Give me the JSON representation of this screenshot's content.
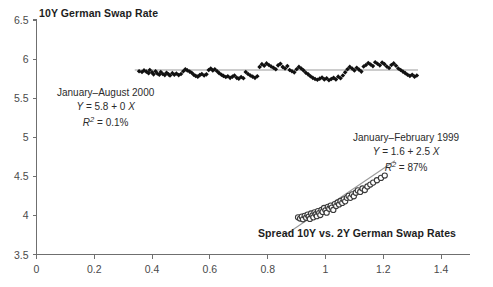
{
  "chart_data": {
    "type": "scatter",
    "title": "10Y German Swap Rate",
    "xlabel": "Spread 10Y vs. 2Y German Swap Rates",
    "ylabel": "10Y German Swap Rate",
    "xlim": [
      0,
      1.5
    ],
    "ylim": [
      3.5,
      6.5
    ],
    "xticks": [
      "0",
      "0.2",
      "0.4",
      "0.6",
      "0.8",
      "1",
      "1.2",
      "1.4"
    ],
    "xtick_values": [
      0,
      0.2,
      0.4,
      0.6,
      0.8,
      1.0,
      1.2,
      1.4
    ],
    "yticks": [
      "3.5",
      "4",
      "4.5",
      "5",
      "5.5",
      "6",
      "6.5"
    ],
    "ytick_values": [
      3.5,
      4,
      4.5,
      5,
      5.5,
      6,
      6.5
    ],
    "grid": false,
    "legend": "none",
    "series": [
      {
        "name": "January–August 2000",
        "marker": "filled-diamond",
        "color": "#111111",
        "equation": "Y = 5.8 + 0 X",
        "r_squared": "R2 = 0.1%",
        "fit": {
          "intercept": 5.86,
          "slope": 0.0,
          "x_start": 0.34,
          "x_end": 1.32
        },
        "points": [
          [
            0.355,
            5.845
          ],
          [
            0.365,
            5.835
          ],
          [
            0.372,
            5.855
          ],
          [
            0.38,
            5.84
          ],
          [
            0.388,
            5.82
          ],
          [
            0.392,
            5.86
          ],
          [
            0.4,
            5.83
          ],
          [
            0.405,
            5.805
          ],
          [
            0.412,
            5.845
          ],
          [
            0.418,
            5.815
          ],
          [
            0.425,
            5.8
          ],
          [
            0.43,
            5.835
          ],
          [
            0.437,
            5.81
          ],
          [
            0.444,
            5.795
          ],
          [
            0.45,
            5.825
          ],
          [
            0.457,
            5.805
          ],
          [
            0.462,
            5.79
          ],
          [
            0.47,
            5.82
          ],
          [
            0.477,
            5.8
          ],
          [
            0.484,
            5.815
          ],
          [
            0.492,
            5.795
          ],
          [
            0.5,
            5.81
          ],
          [
            0.508,
            5.845
          ],
          [
            0.515,
            5.87
          ],
          [
            0.522,
            5.855
          ],
          [
            0.53,
            5.84
          ],
          [
            0.537,
            5.825
          ],
          [
            0.544,
            5.8
          ],
          [
            0.551,
            5.785
          ],
          [
            0.558,
            5.775
          ],
          [
            0.565,
            5.795
          ],
          [
            0.572,
            5.81
          ],
          [
            0.58,
            5.79
          ],
          [
            0.588,
            5.805
          ],
          [
            0.596,
            5.86
          ],
          [
            0.603,
            5.88
          ],
          [
            0.61,
            5.855
          ],
          [
            0.617,
            5.87
          ],
          [
            0.625,
            5.845
          ],
          [
            0.632,
            5.82
          ],
          [
            0.64,
            5.8
          ],
          [
            0.647,
            5.785
          ],
          [
            0.655,
            5.77
          ],
          [
            0.662,
            5.78
          ],
          [
            0.67,
            5.76
          ],
          [
            0.678,
            5.775
          ],
          [
            0.685,
            5.79
          ],
          [
            0.693,
            5.76
          ],
          [
            0.7,
            5.75
          ],
          [
            0.708,
            5.77
          ],
          [
            0.716,
            5.755
          ],
          [
            0.724,
            5.835
          ],
          [
            0.732,
            5.81
          ],
          [
            0.74,
            5.79
          ],
          [
            0.748,
            5.775
          ],
          [
            0.756,
            5.76
          ],
          [
            0.764,
            5.78
          ],
          [
            0.772,
            5.9
          ],
          [
            0.78,
            5.935
          ],
          [
            0.788,
            5.915
          ],
          [
            0.796,
            5.945
          ],
          [
            0.804,
            5.925
          ],
          [
            0.812,
            5.905
          ],
          [
            0.82,
            5.89
          ],
          [
            0.828,
            5.87
          ],
          [
            0.836,
            5.92
          ],
          [
            0.844,
            5.94
          ],
          [
            0.852,
            5.9
          ],
          [
            0.86,
            5.88
          ],
          [
            0.868,
            5.91
          ],
          [
            0.876,
            5.86
          ],
          [
            0.884,
            5.845
          ],
          [
            0.892,
            5.83
          ],
          [
            0.9,
            5.87
          ],
          [
            0.908,
            5.9
          ],
          [
            0.916,
            5.88
          ],
          [
            0.924,
            5.855
          ],
          [
            0.932,
            5.825
          ],
          [
            0.94,
            5.805
          ],
          [
            0.948,
            5.78
          ],
          [
            0.956,
            5.76
          ],
          [
            0.964,
            5.745
          ],
          [
            0.972,
            5.735
          ],
          [
            0.98,
            5.75
          ],
          [
            0.988,
            5.765
          ],
          [
            0.996,
            5.74
          ],
          [
            1.004,
            5.755
          ],
          [
            1.012,
            5.73
          ],
          [
            1.02,
            5.745
          ],
          [
            1.028,
            5.76
          ],
          [
            1.036,
            5.74
          ],
          [
            1.044,
            5.775
          ],
          [
            1.052,
            5.755
          ],
          [
            1.06,
            5.79
          ],
          [
            1.068,
            5.83
          ],
          [
            1.076,
            5.87
          ],
          [
            1.084,
            5.9
          ],
          [
            1.092,
            5.88
          ],
          [
            1.1,
            5.855
          ],
          [
            1.108,
            5.89
          ],
          [
            1.116,
            5.865
          ],
          [
            1.124,
            5.84
          ],
          [
            1.132,
            5.905
          ],
          [
            1.14,
            5.925
          ],
          [
            1.148,
            5.95
          ],
          [
            1.156,
            5.93
          ],
          [
            1.164,
            5.91
          ],
          [
            1.172,
            5.96
          ],
          [
            1.18,
            5.94
          ],
          [
            1.188,
            5.92
          ],
          [
            1.196,
            5.955
          ],
          [
            1.204,
            5.935
          ],
          [
            1.212,
            5.905
          ],
          [
            1.22,
            5.885
          ],
          [
            1.228,
            5.925
          ],
          [
            1.236,
            5.945
          ],
          [
            1.244,
            5.915
          ],
          [
            1.252,
            5.88
          ],
          [
            1.26,
            5.86
          ],
          [
            1.268,
            5.84
          ],
          [
            1.276,
            5.82
          ],
          [
            1.284,
            5.8
          ],
          [
            1.292,
            5.785
          ],
          [
            1.3,
            5.8
          ],
          [
            1.308,
            5.775
          ],
          [
            1.316,
            5.79
          ]
        ]
      },
      {
        "name": "January–February 1999",
        "marker": "open-circle",
        "color": "#3a3a3a",
        "equation": "Y = 1.6 + 2.5 X",
        "r_squared": "R2 = 87%",
        "fit": {
          "intercept": 1.6,
          "slope": 2.5,
          "x_start": 0.86,
          "x_end": 1.24
        },
        "points": [
          [
            0.905,
            3.975
          ],
          [
            0.912,
            3.96
          ],
          [
            0.918,
            3.985
          ],
          [
            0.922,
            3.95
          ],
          [
            0.928,
            3.995
          ],
          [
            0.933,
            3.97
          ],
          [
            0.938,
            4.01
          ],
          [
            0.942,
            3.985
          ],
          [
            0.946,
            3.955
          ],
          [
            0.95,
            4.025
          ],
          [
            0.955,
            4.0
          ],
          [
            0.958,
            3.975
          ],
          [
            0.962,
            4.04
          ],
          [
            0.966,
            4.015
          ],
          [
            0.97,
            3.99
          ],
          [
            0.974,
            4.055
          ],
          [
            0.978,
            4.03
          ],
          [
            0.982,
            4.005
          ],
          [
            0.986,
            4.07
          ],
          [
            0.99,
            4.045
          ],
          [
            0.995,
            4.095
          ],
          [
            1.0,
            4.065
          ],
          [
            1.004,
            4.035
          ],
          [
            1.008,
            4.11
          ],
          [
            1.013,
            4.085
          ],
          [
            1.018,
            4.125
          ],
          [
            1.022,
            4.1
          ],
          [
            1.027,
            4.07
          ],
          [
            1.032,
            4.145
          ],
          [
            1.037,
            4.12
          ],
          [
            1.042,
            4.165
          ],
          [
            1.047,
            4.14
          ],
          [
            1.052,
            4.185
          ],
          [
            1.058,
            4.16
          ],
          [
            1.063,
            4.205
          ],
          [
            1.068,
            4.18
          ],
          [
            1.074,
            4.225
          ],
          [
            1.08,
            4.25
          ],
          [
            1.086,
            4.225
          ],
          [
            1.092,
            4.27
          ],
          [
            1.098,
            4.245
          ],
          [
            1.105,
            4.29
          ],
          [
            1.112,
            4.32
          ],
          [
            1.12,
            4.3
          ],
          [
            1.128,
            4.345
          ],
          [
            1.136,
            4.325
          ],
          [
            1.145,
            4.37
          ],
          [
            1.155,
            4.395
          ],
          [
            1.165,
            4.42
          ],
          [
            1.178,
            4.45
          ],
          [
            1.192,
            4.48
          ],
          [
            1.205,
            4.51
          ]
        ]
      }
    ],
    "annotations": [
      {
        "id": "annot-2000",
        "lines": [
          "January–August 2000",
          "Y = 5.8 + 0 X",
          "R2 = 0.1%"
        ]
      },
      {
        "id": "annot-1999",
        "lines": [
          "January–February 1999",
          "Y = 1.6 + 2.5 X",
          "R2 = 87%"
        ]
      }
    ]
  },
  "labels": {
    "title": "10Y German Swap Rate",
    "xaxis_title": "Spread 10Y vs. 2Y German Swap Rates",
    "annot_2000": {
      "period": "January–August 2000",
      "eq_y": "Y",
      "eq_rest": " = 5.8 + 0 ",
      "eq_x": "X",
      "r_sym": "R",
      "r_sup": "2",
      "r_val": " = 0.1%"
    },
    "annot_1999": {
      "period": "January–February 1999",
      "eq_y": "Y",
      "eq_rest": " = 1.6 + 2.5 ",
      "eq_x": "X",
      "r_sym": "R",
      "r_sup": "2",
      "r_val": " = 87%"
    }
  }
}
